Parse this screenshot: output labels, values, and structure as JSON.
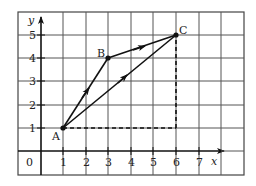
{
  "diagram": {
    "type": "coordinate-grid-vectors",
    "grid": {
      "columns": 10,
      "rows": 7,
      "line_color": "#444444",
      "frame": {
        "left": 18,
        "top": 12,
        "right": 244,
        "bottom": 175
      }
    },
    "axes": {
      "x_label": "x",
      "y_label": "y",
      "origin_label": "0",
      "x_ticks": [
        "1",
        "2",
        "3",
        "4",
        "5",
        "6",
        "7"
      ],
      "y_ticks": [
        "1",
        "2",
        "3",
        "4",
        "5"
      ]
    },
    "points": [
      {
        "name": "A",
        "x": 1,
        "y": 1
      },
      {
        "name": "B",
        "x": 3,
        "y": 4
      },
      {
        "name": "C",
        "x": 6,
        "y": 5
      }
    ],
    "vectors": [
      {
        "from": "A",
        "to": "B",
        "style": "solid-arrow"
      },
      {
        "from": "B",
        "to": "C",
        "style": "solid-arrow"
      },
      {
        "from": "A",
        "to": "C",
        "style": "solid-arrow"
      }
    ],
    "dashed_lines": [
      {
        "from": [
          1,
          1
        ],
        "to": [
          6,
          1
        ]
      },
      {
        "from": [
          6,
          1
        ],
        "to": [
          6,
          5
        ]
      }
    ],
    "colors": {
      "line": "#111111",
      "grid": "#444444",
      "text": "#222222"
    }
  }
}
